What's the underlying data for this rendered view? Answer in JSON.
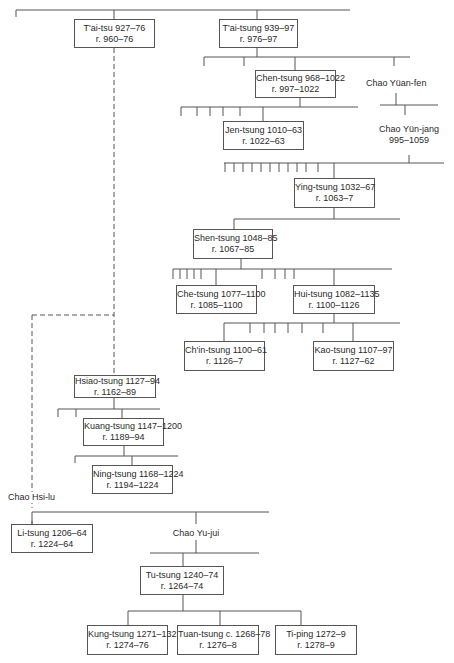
{
  "persons": {
    "taitsu": {
      "name": "T'ai-tsu 927–76",
      "reign": "r. 960–76"
    },
    "taitsung": {
      "name": "T'ai-tsung 939–97",
      "reign": "r. 976–97"
    },
    "chentsung": {
      "name": "Chen-tsung 968–1022",
      "reign": "r. 997–1022"
    },
    "chaoyuanfen": {
      "name": "Chao Yüan-fen"
    },
    "jentsung": {
      "name": "Jen-tsung 1010–63",
      "reign": "r. 1022–63"
    },
    "chaoyunjang": {
      "name": "Chao Yün-jang",
      "dates": "995–1059"
    },
    "yingtsung": {
      "name": "Ying-tsung 1032–67",
      "reign": "r. 1063–7"
    },
    "shentsung": {
      "name": "Shen-tsung 1048–85",
      "reign": "r. 1067–85"
    },
    "chetsung": {
      "name": "Che-tsung 1077–1100",
      "reign": "r. 1085–1100"
    },
    "huitsung": {
      "name": "Hui-tsung 1082–1135",
      "reign": "r. 1100–1126"
    },
    "chintsung": {
      "name": "Ch'in-tsung 1100–61",
      "reign": "r. 1126–7"
    },
    "kaotsung": {
      "name": "Kao-tsung 1107–97",
      "reign": "r. 1127–62"
    },
    "hsiaotsung": {
      "name": "Hsiao-tsung 1127–94",
      "reign": "r. 1162–89"
    },
    "kuangtsung": {
      "name": "Kuang-tsung 1147–1200",
      "reign": "r. 1189–94"
    },
    "ningtsung": {
      "name": "Ning-tsung 1168–1224",
      "reign": "r. 1194–1224"
    },
    "chaohsilu": {
      "name": "Chao Hsi-lu"
    },
    "litsung": {
      "name": "Li-tsung 1206–64",
      "reign": "r. 1224–64"
    },
    "chaoyujui": {
      "name": "Chao Yu-jui"
    },
    "tutsung": {
      "name": "Tu-tsung 1240–74",
      "reign": "r. 1264–74"
    },
    "kungtsung": {
      "name": "Kung-tsung 1271–1323",
      "reign": "r. 1274–76"
    },
    "tuantsung": {
      "name": "Tuan-tsung c. 1268–78",
      "reign": "r. 1276–8"
    },
    "tiping": {
      "name": "Ti-ping 1272–9",
      "reign": "r. 1278–9"
    }
  },
  "legend": {
    "solid_line": "descent",
    "dashed_line": "adoptive / indirect descent"
  }
}
